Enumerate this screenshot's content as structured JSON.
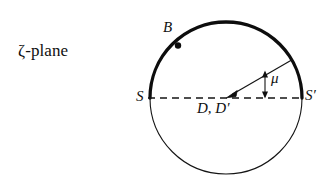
{
  "figure": {
    "caption_label": "ζ-plane",
    "background_color": "#ffffff",
    "ink_color": "#101010"
  },
  "labels": {
    "plane": "ζ-plane",
    "point_b": "B",
    "point_s": "S",
    "point_s_prime": "S′",
    "center": "D, D′",
    "angle": "μ"
  },
  "geometry": {
    "circle": {
      "center_x": 226,
      "center_y": 98,
      "radius": 76,
      "thick_arc_description": "upper semicircle from S to S-prime is heavy",
      "thin_stroke_width": 1,
      "thick_stroke_width": 3.2
    },
    "diameter": {
      "x1": 150,
      "y1": 98,
      "x2": 302,
      "y2": 98,
      "style": "dashed",
      "dash_pattern": "7 5"
    },
    "radius_line": {
      "from_x": 226,
      "from_y": 98,
      "to_x": 293,
      "to_y": 59,
      "angle_degrees": 30,
      "arrowhead_at": "center"
    },
    "point_b": {
      "x": 178,
      "y": 45,
      "dot_radius": 3.1
    },
    "angle_marker": {
      "x": 265,
      "y_top": 71,
      "y_bottom": 97,
      "style": "double-headed vertical arrow"
    }
  }
}
